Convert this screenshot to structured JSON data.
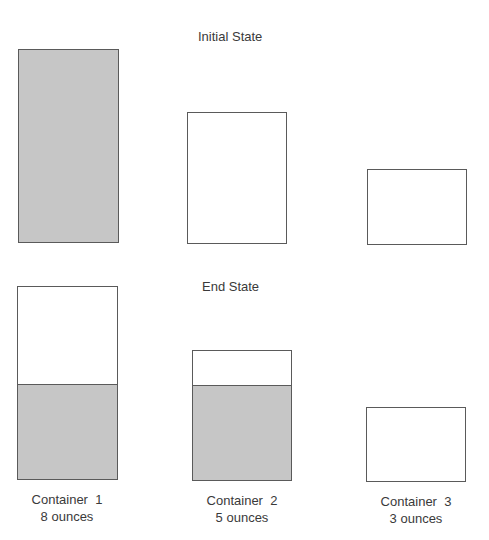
{
  "initial": {
    "title": "Initial State",
    "containers": [
      {
        "name": "Container 1",
        "capacity_oz": 8,
        "contents_oz": 8
      },
      {
        "name": "Container 2",
        "capacity_oz": 5,
        "contents_oz": 0
      },
      {
        "name": "Container 3",
        "capacity_oz": 3,
        "contents_oz": 0
      }
    ]
  },
  "end": {
    "title": "End State",
    "containers": [
      {
        "name": "Container 1",
        "capacity_oz": 8,
        "contents_oz": 4
      },
      {
        "name": "Container 2",
        "capacity_oz": 5,
        "contents_oz": 4
      },
      {
        "name": "Container 3",
        "capacity_oz": 3,
        "contents_oz": 0
      }
    ]
  },
  "labels": [
    {
      "name": "Container  1",
      "capacity": "8 ounces"
    },
    {
      "name": "Container  2",
      "capacity": "5 ounces"
    },
    {
      "name": "Container  3",
      "capacity": "3 ounces"
    }
  ],
  "colors": {
    "liquid": "#c6c6c6",
    "outline": "#5a5a5a",
    "text": "#3a3a3a"
  }
}
